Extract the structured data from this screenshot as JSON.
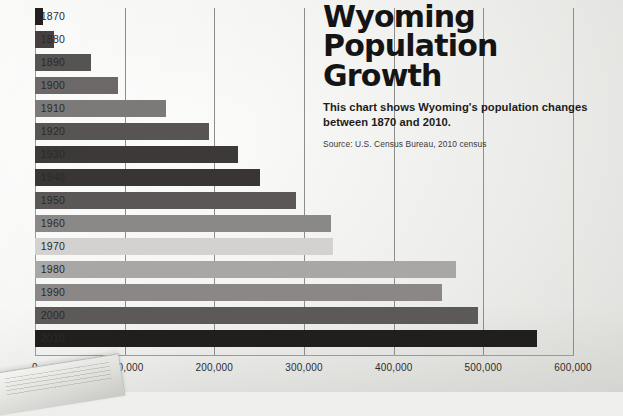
{
  "title": "Wyoming\nPopulation\nGrowth",
  "description": "This chart shows Wyoming's population changes between 1870 and 2010.",
  "source": "Source: U.S. Census Bureau, 2010 census",
  "chart_data": {
    "type": "bar",
    "orientation": "horizontal",
    "title": "Wyoming Population Growth",
    "subtitle": "This chart shows Wyoming's population changes between 1870 and 2010.",
    "source": "Source: U.S. Census Bureau, 2010 census",
    "xlabel": "",
    "ylabel": "",
    "xlim": [
      0,
      600000
    ],
    "grid": true,
    "legend": null,
    "xticks": [
      0,
      100000,
      200000,
      300000,
      400000,
      500000,
      600000
    ],
    "xticklabels": [
      "0",
      "100,000",
      "200,000",
      "300,000",
      "400,000",
      "500,000",
      "600,000"
    ],
    "categories": [
      "1870",
      "1880",
      "1890",
      "1900",
      "1910",
      "1920",
      "1930",
      "1940",
      "1950",
      "1960",
      "1970",
      "1980",
      "1990",
      "2000",
      "2010"
    ],
    "values": [
      9000,
      21000,
      63000,
      93000,
      146000,
      194000,
      226000,
      251000,
      291000,
      330000,
      332000,
      470000,
      454000,
      494000,
      560000
    ],
    "bar_colors": [
      "#231f1f",
      "#45403f",
      "#565353",
      "#6b6867",
      "#7c7a79",
      "#575453",
      "#3c3938",
      "#383534",
      "#5a5756",
      "#8b8888",
      "#d3d2d0",
      "#a9a7a5",
      "#8a8786",
      "#5c5958",
      "#211e1e"
    ]
  },
  "colors": {
    "grid": "#8d8d8d",
    "axis": "#9a9a9a",
    "text": "#1c1c1c",
    "background": "#f2f2f0"
  }
}
